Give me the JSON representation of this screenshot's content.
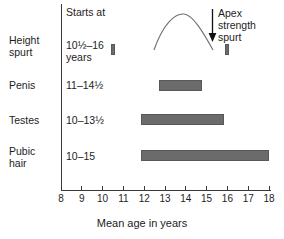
{
  "chart_data": {
    "type": "bar",
    "title": "",
    "xlabel": "Mean age in years",
    "ylabel": "",
    "xlim": [
      8,
      18
    ],
    "xticks": [
      8,
      9,
      10,
      11,
      12,
      13,
      14,
      15,
      16,
      17,
      18
    ],
    "xtick_labels": [
      "8",
      "9",
      "10",
      "11",
      "12",
      "13",
      "14",
      "15",
      "16",
      "17",
      "18"
    ],
    "grid": false,
    "legend": "none",
    "bar_color": "#6b6b6b",
    "axis_color": "#3a3a3a",
    "column_header": "Starts at",
    "categories": [
      "Height spurt",
      "Penis",
      "Testes",
      "Pubic hair"
    ],
    "series": [
      {
        "name": "Age range (years)",
        "bars": [
          {
            "category": "Height spurt",
            "start": 10.5,
            "end": 16.0,
            "style": "endpoints-only"
          },
          {
            "category": "Penis",
            "start": 12.7,
            "end": 14.8,
            "style": "bar"
          },
          {
            "category": "Testes",
            "start": 11.85,
            "end": 15.85,
            "style": "bar"
          },
          {
            "category": "Pubic hair",
            "start": 11.85,
            "end": 18.0,
            "style": "bar"
          }
        ]
      }
    ],
    "annotations": [
      {
        "text": "Apex strength spurt",
        "target_x": 15.5,
        "type": "arrow-down"
      }
    ],
    "curve": {
      "description": "arc connecting height spurt endpoints, peak near age 14",
      "peak_age": 14.0
    }
  },
  "rows": [
    {
      "label": "Height\nspurt",
      "starts_at": "10½–16\nyears"
    },
    {
      "label": "Penis",
      "starts_at": "11–14½"
    },
    {
      "label": "Testes",
      "starts_at": "10–13½"
    },
    {
      "label": "Pubic\nhair",
      "starts_at": "10–15"
    }
  ],
  "header": {
    "column_label": "Starts at"
  },
  "annotation": {
    "apex_label": "Apex\nstrength\nspurt"
  },
  "axis": {
    "title": "Mean age in years",
    "ticks": [
      "8",
      "9",
      "10",
      "11",
      "12",
      "13",
      "14",
      "15",
      "16",
      "17",
      "18"
    ]
  }
}
